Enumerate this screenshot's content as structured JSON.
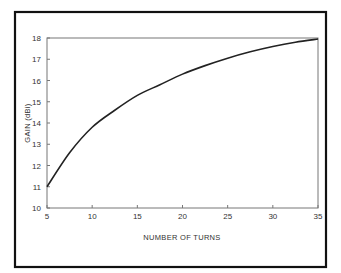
{
  "chart_data": {
    "type": "line",
    "title": "",
    "xlabel": "NUMBER OF TURNS",
    "ylabel": "GAIN (dBi)",
    "xlim": [
      5,
      35
    ],
    "ylim": [
      10,
      18
    ],
    "x_ticks": [
      5,
      10,
      15,
      20,
      25,
      30,
      35
    ],
    "y_ticks": [
      10,
      11,
      12,
      13,
      14,
      15,
      16,
      17,
      18
    ],
    "grid": false,
    "legend": null,
    "series": [
      {
        "name": "Gain",
        "x": [
          5,
          7.5,
          10,
          12.5,
          15,
          17.5,
          20,
          22.5,
          25,
          27.5,
          30,
          32.5,
          35
        ],
        "values": [
          11.0,
          12.6,
          13.8,
          14.6,
          15.3,
          15.8,
          16.3,
          16.7,
          17.05,
          17.35,
          17.6,
          17.8,
          17.95
        ]
      }
    ]
  }
}
